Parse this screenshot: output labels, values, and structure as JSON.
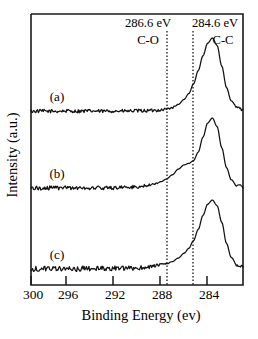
{
  "figure": {
    "kind": "xps-spectrum-figure",
    "background_color": "#ffffff",
    "line_color": "#111111"
  },
  "chart_data": {
    "type": "line",
    "title": "",
    "xlabel": "Binding Energy (ev)",
    "ylabel": "Intensity (a.u.)",
    "xlim": [
      300,
      282
    ],
    "x_axis_inverted": true,
    "ylim": [
      0,
      1
    ],
    "grid": false,
    "legend": "none",
    "xticks": [
      300,
      296,
      292,
      288,
      284
    ],
    "xtick_labels": [
      "300",
      "296",
      "292",
      "288",
      "284"
    ],
    "yticks": [],
    "ytick_labels": [],
    "annotations": [
      {
        "name": "c-o-guide",
        "energy_label": "286.6 eV",
        "bond_label": "C-O",
        "x_value": 286.6,
        "line_style": "dotted"
      },
      {
        "name": "c-c-guide",
        "energy_label": "284.6 eV",
        "bond_label": "C-C",
        "x_value": 284.6,
        "line_style": "dotted"
      }
    ],
    "series": [
      {
        "name": "(a)",
        "label": "(a)",
        "baseline_offset": 0,
        "peaks": [
          {
            "center": 284.6,
            "height": 1.0,
            "width": 1.25,
            "assignment": "C-C"
          },
          {
            "center": 286.4,
            "height": 0.16,
            "width": 1.4,
            "assignment": "C-O"
          }
        ],
        "noise_amplitude": 0.012,
        "x": [
          300.0,
          299.0,
          298.0,
          297.0,
          296.0,
          295.0,
          294.0,
          293.0,
          292.0,
          291.0,
          290.0,
          289.5,
          289.0,
          288.5,
          288.0,
          287.5,
          287.0,
          286.6,
          286.2,
          285.8,
          285.4,
          285.0,
          284.6,
          284.2,
          283.8,
          283.4,
          283.0,
          282.5,
          282.0
        ],
        "y": [
          0.01,
          0.012,
          0.01,
          0.014,
          0.011,
          0.013,
          0.01,
          0.014,
          0.012,
          0.015,
          0.018,
          0.022,
          0.028,
          0.04,
          0.06,
          0.1,
          0.17,
          0.25,
          0.38,
          0.56,
          0.76,
          0.93,
          1.0,
          0.9,
          0.62,
          0.33,
          0.15,
          0.06,
          0.03
        ]
      },
      {
        "name": "(b)",
        "label": "(b)",
        "baseline_offset": 0,
        "peaks": [
          {
            "center": 284.6,
            "height": 1.0,
            "width": 1.05,
            "assignment": "C-C"
          },
          {
            "center": 286.6,
            "height": 0.36,
            "width": 1.5,
            "assignment": "C-O"
          }
        ],
        "noise_amplitude": 0.015,
        "x": [
          300.0,
          299.0,
          298.0,
          297.0,
          296.0,
          295.0,
          294.0,
          293.0,
          292.0,
          291.0,
          290.5,
          290.0,
          289.5,
          289.0,
          288.5,
          288.0,
          287.5,
          287.0,
          286.6,
          286.2,
          285.8,
          285.4,
          285.0,
          284.6,
          284.2,
          283.8,
          283.4,
          283.0,
          282.5,
          282.0
        ],
        "y": [
          0.012,
          0.015,
          0.013,
          0.016,
          0.014,
          0.017,
          0.015,
          0.019,
          0.022,
          0.03,
          0.04,
          0.055,
          0.075,
          0.1,
          0.14,
          0.2,
          0.28,
          0.34,
          0.36,
          0.4,
          0.52,
          0.73,
          0.93,
          1.0,
          0.88,
          0.58,
          0.3,
          0.13,
          0.05,
          0.03
        ]
      },
      {
        "name": "(c)",
        "label": "(c)",
        "baseline_offset": 0,
        "peaks": [
          {
            "center": 284.6,
            "height": 1.0,
            "width": 1.15,
            "assignment": "C-C"
          },
          {
            "center": 287.0,
            "height": 0.18,
            "width": 1.9,
            "assignment": "C-O"
          }
        ],
        "noise_amplitude": 0.02,
        "x": [
          300.0,
          299.0,
          298.0,
          297.0,
          296.0,
          295.0,
          294.0,
          293.0,
          292.0,
          291.0,
          290.5,
          290.0,
          289.5,
          289.0,
          288.5,
          288.0,
          287.5,
          287.0,
          286.6,
          286.2,
          285.8,
          285.4,
          285.0,
          284.6,
          284.2,
          283.8,
          283.4,
          283.0,
          282.5,
          282.0
        ],
        "y": [
          0.015,
          0.02,
          0.016,
          0.022,
          0.017,
          0.024,
          0.018,
          0.025,
          0.02,
          0.028,
          0.035,
          0.045,
          0.06,
          0.075,
          0.09,
          0.12,
          0.17,
          0.24,
          0.31,
          0.42,
          0.58,
          0.78,
          0.94,
          1.0,
          0.92,
          0.68,
          0.38,
          0.18,
          0.07,
          0.04
        ]
      }
    ]
  },
  "layout": {
    "plot_left_px": 31,
    "plot_right_px": 243,
    "plot_top_px": 14,
    "plot_bottom_px": 285,
    "panel_baselines_px": [
      112,
      189,
      270
    ],
    "panel_peak_tops_px": [
      38,
      118,
      200
    ],
    "curve_label_positions_px": [
      [
        56,
        98
      ],
      [
        56,
        175
      ],
      [
        56,
        256
      ]
    ]
  }
}
